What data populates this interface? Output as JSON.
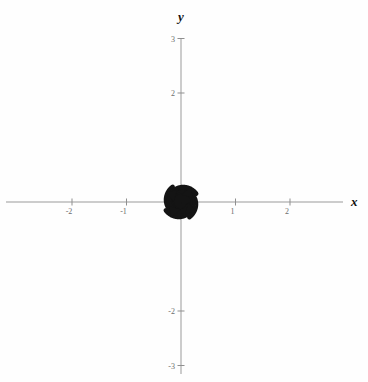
{
  "figure": {
    "kind": "phase-portrait",
    "background_color": "#fefefe",
    "curve_color": "#141414",
    "axis_color": "#9a9a9a",
    "label_color": "#6d6d6d"
  },
  "axes": {
    "x_label": "x",
    "y_label": "y",
    "x_ticks": [
      {
        "value": -2,
        "label": "-2"
      },
      {
        "value": -1,
        "label": "-1"
      },
      {
        "value": 1,
        "label": "1"
      },
      {
        "value": 2,
        "label": "2"
      }
    ],
    "y_ticks": [
      {
        "value": 3,
        "label": "3"
      },
      {
        "value": 2,
        "label": "2"
      },
      {
        "value": -2,
        "label": "-2"
      },
      {
        "value": -3,
        "label": "-3"
      }
    ]
  },
  "chart_data": {
    "type": "line",
    "title": "",
    "xlabel": "x",
    "ylabel": "y",
    "xlim": [
      -3.32,
      3.43
    ],
    "ylim": [
      -3.3,
      3.15
    ],
    "grid": false,
    "legend": "none",
    "origin_px": [
      181,
      202
    ],
    "pixels_per_unit": 54.5,
    "spiral": {
      "direction": "clockwise-inward",
      "decay_rate_b": 0.145,
      "start_radius_units": 0.035,
      "turns": 2.42
    },
    "series": [
      {
        "name": "trajectory-1",
        "start_angle_deg": 90,
        "arrow_at_fraction": 0.62,
        "arrow_label": "flow-direction"
      },
      {
        "name": "trajectory-2",
        "start_angle_deg": 0,
        "arrow_at_fraction": 0.62,
        "arrow_label": "flow-direction"
      },
      {
        "name": "trajectory-3",
        "start_angle_deg": 270,
        "arrow_at_fraction": 0.62,
        "arrow_label": "flow-direction"
      },
      {
        "name": "trajectory-4",
        "start_angle_deg": 180,
        "arrow_at_fraction": 0.62,
        "arrow_label": "flow-direction"
      }
    ]
  }
}
